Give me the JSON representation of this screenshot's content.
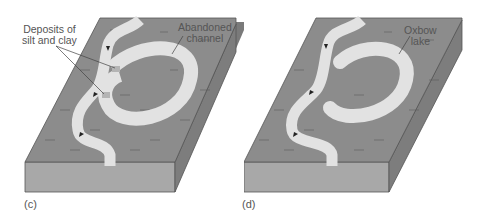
{
  "figure": {
    "panels": [
      {
        "id": "c",
        "caption": "(c)",
        "labels": {
          "deposits_line1": "Deposits of",
          "deposits_line2": "silt and clay",
          "abandoned_line1": "Abandoned",
          "abandoned_line2": "channel"
        }
      },
      {
        "id": "d",
        "caption": "(d)",
        "labels": {
          "oxbow_line1": "Oxbow",
          "oxbow_line2": "lake"
        }
      }
    ],
    "colors": {
      "floodplain_top": "#8c8c8c",
      "block_front": "#a8a8a8",
      "block_side": "#7a7a7a",
      "water": "#e2e2e2",
      "deposit": "#b4b4b4",
      "outline": "#444444",
      "text": "#555555"
    }
  }
}
